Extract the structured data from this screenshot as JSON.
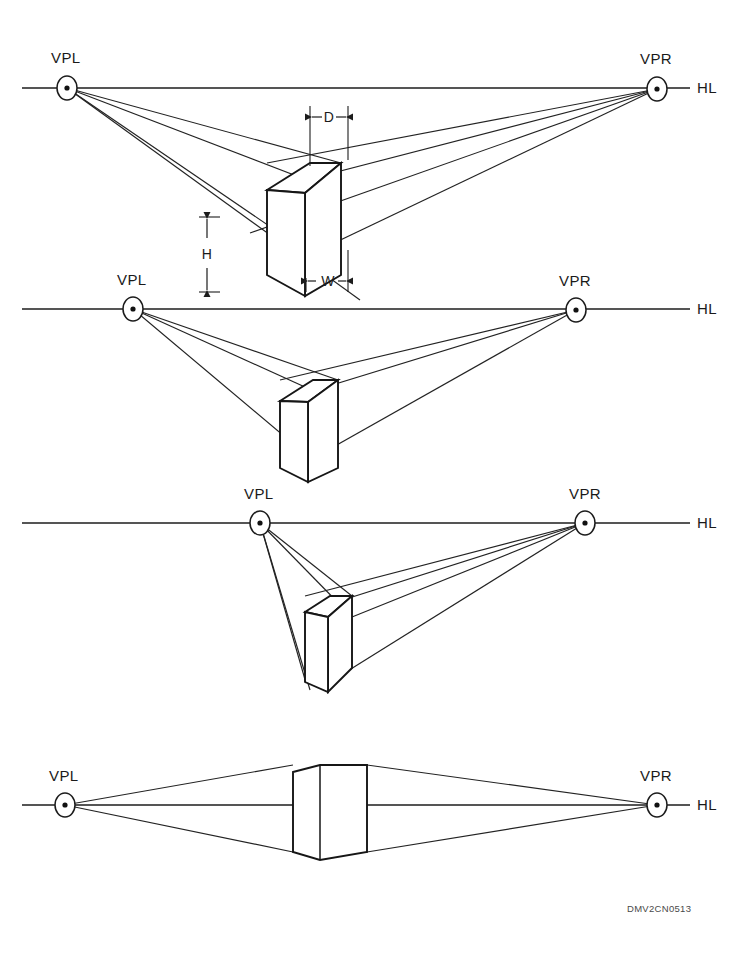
{
  "figure": {
    "code": "DMV2CN0513",
    "background_color": "#ffffff",
    "line_color": "#1c1c1c"
  },
  "labels": {
    "vpl": "VPL",
    "vpr": "VPR",
    "hl": "HL",
    "depth": "D",
    "width": "W",
    "height": "H"
  },
  "diagrams": [
    {
      "name": "diagram-1-wide-spread",
      "vpl_label": "VPL",
      "vpr_label": "VPR",
      "hl_label": "HL",
      "dimension_labels": [
        "D",
        "W",
        "H"
      ],
      "horizon_y": 88,
      "vpl_x": 67,
      "vpr_x": 657,
      "box_front_left_x": 267,
      "box_front_right_x": 341,
      "box_top_y": 163,
      "box_bottom_y": 275
    },
    {
      "name": "diagram-2-medium-spread",
      "vpl_label": "VPL",
      "vpr_label": "VPR",
      "hl_label": "HL",
      "dimension_labels": [],
      "horizon_y": 309,
      "vpl_x": 133,
      "vpr_x": 576,
      "box_front_left_x": 280,
      "box_front_right_x": 338,
      "box_top_y": 380,
      "box_bottom_y": 468
    },
    {
      "name": "diagram-3-vpl-near",
      "vpl_label": "VPL",
      "vpr_label": "VPR",
      "hl_label": "HL",
      "dimension_labels": [],
      "horizon_y": 523,
      "vpl_x": 260,
      "vpr_x": 585,
      "box_front_left_x": 305,
      "box_front_right_x": 352,
      "box_top_y": 596,
      "box_bottom_y": 682
    },
    {
      "name": "diagram-4-on-horizon",
      "vpl_label": "VPL",
      "vpr_label": "VPR",
      "hl_label": "HL",
      "dimension_labels": [],
      "horizon_y": 805,
      "vpl_x": 65,
      "vpr_x": 657,
      "box_front_left_x": 293,
      "box_front_right_x": 367,
      "box_top_y": 765,
      "box_bottom_y": 852
    }
  ]
}
